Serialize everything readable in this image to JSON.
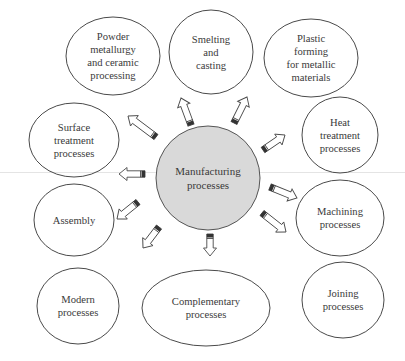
{
  "diagram": {
    "center": {
      "label": "Manufacturing\nprocesses",
      "cx": 208,
      "cy": 178,
      "r": 52,
      "fill": "#d9d9d9",
      "stroke": "#555555"
    },
    "nodes": [
      {
        "id": "powder",
        "label": "Powder\nmetallurgy\nand ceramic\nprocessing",
        "cx": 113,
        "cy": 56,
        "rx": 47,
        "ry": 39
      },
      {
        "id": "smelting",
        "label": "Smelting\nand\ncasting",
        "cx": 211,
        "cy": 52,
        "rx": 42,
        "ry": 42
      },
      {
        "id": "plastic",
        "label": "Plastic\nforming\nfor metallic\nmaterials",
        "cx": 311,
        "cy": 58,
        "rx": 47,
        "ry": 39
      },
      {
        "id": "heat",
        "label": "Heat\ntreatment\nprocesses",
        "cx": 340,
        "cy": 135,
        "rx": 38,
        "ry": 38
      },
      {
        "id": "machining",
        "label": "Machining\nprocesses",
        "cx": 340,
        "cy": 218,
        "rx": 44,
        "ry": 38
      },
      {
        "id": "joining",
        "label": "Joining\nprocesses",
        "cx": 343,
        "cy": 300,
        "rx": 41,
        "ry": 38
      },
      {
        "id": "complementary",
        "label": "Complementary\nprocesses",
        "cx": 206,
        "cy": 308,
        "rx": 64,
        "ry": 38
      },
      {
        "id": "modern",
        "label": "Modern\nprocesses",
        "cx": 78,
        "cy": 306,
        "rx": 41,
        "ry": 38
      },
      {
        "id": "assembly",
        "label": "Assembly",
        "cx": 74,
        "cy": 220,
        "rx": 40,
        "ry": 36
      },
      {
        "id": "surface",
        "label": "Surface\ntreatment\nprocesses",
        "cx": 74,
        "cy": 140,
        "rx": 45,
        "ry": 37
      }
    ],
    "arrows": [
      {
        "to": "smelting",
        "x1": 191,
        "y1": 125,
        "x2": 181,
        "y2": 98
      },
      {
        "to": "plastic",
        "x1": 234,
        "y1": 123,
        "x2": 247,
        "y2": 97
      },
      {
        "to": "heat",
        "x1": 263,
        "y1": 150,
        "x2": 285,
        "y2": 135
      },
      {
        "to": "machining",
        "x1": 270,
        "y1": 187,
        "x2": 297,
        "y2": 198
      },
      {
        "to": "joining",
        "x1": 262,
        "y1": 213,
        "x2": 286,
        "y2": 232
      },
      {
        "to": "complementary",
        "x1": 210,
        "y1": 234,
        "x2": 210,
        "y2": 256
      },
      {
        "to": "modern",
        "x1": 159,
        "y1": 227,
        "x2": 143,
        "y2": 248
      },
      {
        "to": "assembly",
        "x1": 138,
        "y1": 202,
        "x2": 117,
        "y2": 219
      },
      {
        "to": "surface",
        "x1": 145,
        "y1": 174,
        "x2": 119,
        "y2": 174
      },
      {
        "to": "powder",
        "x1": 156,
        "y1": 137,
        "x2": 128,
        "y2": 116
      }
    ],
    "colors": {
      "stroke": "#4a4a4a",
      "text": "#3a3a3a",
      "arrow_fill": "#ffffff",
      "arrow_tail": "#333333",
      "background": "#ffffff"
    }
  }
}
